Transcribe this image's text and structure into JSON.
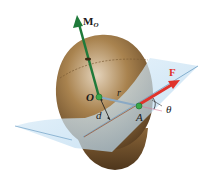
{
  "figure": {
    "labels": {
      "moment": "M",
      "moment_sub": "O",
      "force": "F",
      "origin": "O",
      "point": "A",
      "position_vector": "r",
      "moment_arm": "d",
      "angle": "θ"
    },
    "colors": {
      "moment_vector": "#1f7a3a",
      "force_vector": "#e0332b",
      "position_vector": "#8aa9c4",
      "plane": "#cfe6f5",
      "plane_edge": "#6f9fc4",
      "body": "#9a7447",
      "body_dark": "#5c4022",
      "point_marker": "#3aa84a"
    }
  }
}
